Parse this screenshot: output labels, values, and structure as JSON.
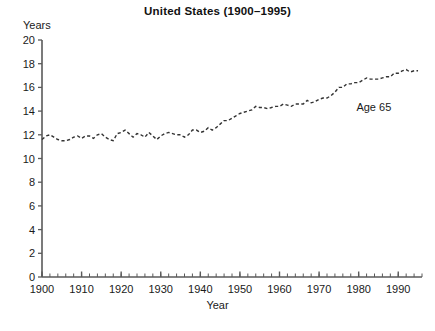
{
  "chart_data": {
    "type": "line",
    "title": "United States (1900–1995)",
    "xlabel": "Year",
    "ylabel": "Years",
    "ylim": [
      0,
      20
    ],
    "xlim": [
      1900,
      1996
    ],
    "ytick_step": 2,
    "xtick_step": 10,
    "x_minor_tick_step": 2,
    "grid": false,
    "legend": "none",
    "line_style": "dashed",
    "line_color": "#333333",
    "annotations": [
      {
        "text": "Age 65",
        "x": 1986,
        "y": 14.2
      }
    ],
    "yticks": [
      0,
      2,
      4,
      6,
      8,
      10,
      12,
      14,
      16,
      18,
      20
    ],
    "xticks": [
      1900,
      1910,
      1920,
      1930,
      1940,
      1950,
      1960,
      1970,
      1980,
      1990
    ],
    "series": [
      {
        "name": "Age 65",
        "x": [
          1900,
          1901,
          1902,
          1903,
          1904,
          1905,
          1906,
          1907,
          1908,
          1909,
          1910,
          1911,
          1912,
          1913,
          1914,
          1915,
          1916,
          1917,
          1918,
          1919,
          1920,
          1921,
          1922,
          1923,
          1924,
          1925,
          1926,
          1927,
          1928,
          1929,
          1930,
          1931,
          1932,
          1933,
          1934,
          1935,
          1936,
          1937,
          1938,
          1939,
          1940,
          1941,
          1942,
          1943,
          1944,
          1945,
          1946,
          1947,
          1948,
          1949,
          1950,
          1951,
          1952,
          1953,
          1954,
          1955,
          1956,
          1957,
          1958,
          1959,
          1960,
          1961,
          1962,
          1963,
          1964,
          1965,
          1966,
          1967,
          1968,
          1969,
          1970,
          1971,
          1972,
          1973,
          1974,
          1975,
          1976,
          1977,
          1978,
          1979,
          1980,
          1981,
          1982,
          1983,
          1984,
          1985,
          1986,
          1987,
          1988,
          1989,
          1990,
          1991,
          1992,
          1993,
          1994,
          1995
        ],
        "values": [
          11.6,
          11.9,
          12.0,
          11.8,
          11.6,
          11.5,
          11.5,
          11.6,
          11.8,
          11.9,
          11.7,
          11.9,
          11.9,
          11.7,
          12.0,
          12.1,
          11.8,
          11.6,
          11.5,
          12.1,
          12.2,
          12.4,
          12.1,
          11.8,
          12.1,
          12.0,
          11.8,
          12.2,
          11.9,
          11.6,
          11.9,
          12.1,
          12.2,
          12.1,
          12.0,
          12.0,
          11.8,
          12.0,
          12.4,
          12.4,
          12.2,
          12.3,
          12.6,
          12.4,
          12.6,
          12.9,
          13.2,
          13.2,
          13.4,
          13.6,
          13.8,
          13.9,
          14.0,
          14.1,
          14.4,
          14.3,
          14.3,
          14.2,
          14.3,
          14.4,
          14.4,
          14.6,
          14.5,
          14.4,
          14.6,
          14.6,
          14.6,
          14.9,
          14.7,
          14.8,
          15.0,
          15.1,
          15.1,
          15.3,
          15.6,
          16.0,
          16.0,
          16.3,
          16.3,
          16.4,
          16.4,
          16.6,
          16.8,
          16.7,
          16.7,
          16.7,
          16.8,
          16.9,
          16.9,
          17.2,
          17.2,
          17.4,
          17.5,
          17.3,
          17.4,
          17.4
        ]
      }
    ]
  },
  "labels": {
    "title": "United States (1900–1995)",
    "y_axis": "Years",
    "x_axis": "Year",
    "series_annotation": "Age 65"
  }
}
